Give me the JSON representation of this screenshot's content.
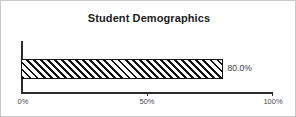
{
  "chart_data": {
    "type": "bar",
    "orientation": "horizontal",
    "title": "Student Demographics",
    "xlabel": "",
    "ylabel": "",
    "categories": [
      ""
    ],
    "values": [
      80.0
    ],
    "data_labels": [
      "80.0%"
    ],
    "xlim": [
      0,
      100
    ],
    "xticks": [
      0,
      50,
      100
    ],
    "xtick_labels": [
      "0%",
      "50%",
      "100%"
    ],
    "grid": false,
    "legend": false,
    "bar_style": {
      "fill": "#ffffff",
      "hatch": "diagonal-forward-slash",
      "hatch_color": "#111111",
      "edge_color": "#111111"
    },
    "axis_color": "#2c2c2c",
    "background": "#ffffff",
    "frame_color": "#c9c9c9"
  }
}
